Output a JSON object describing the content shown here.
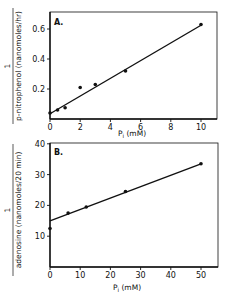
{
  "chart_data": [
    {
      "type": "scatter",
      "panel_label": "A.",
      "title": "",
      "xlabel": "Pi (mM)",
      "ylabel_numerator": "1",
      "ylabel_denominator": "p-nitrophenol (nanomoles/hr)",
      "xlim": [
        0,
        11
      ],
      "ylim": [
        0,
        0.7
      ],
      "x_ticks": [
        0,
        2,
        4,
        6,
        8,
        10
      ],
      "y_ticks": [
        0.2,
        0.4,
        0.6
      ],
      "x_tick_labels": [
        "0",
        "2",
        "4",
        "6",
        "8",
        "10"
      ],
      "y_tick_labels": [
        "0.2",
        "0.4",
        "0.6"
      ],
      "grid": false,
      "series": [
        {
          "name": "data",
          "x": [
            0,
            0.5,
            1,
            2,
            3,
            5,
            10
          ],
          "y": [
            0.04,
            0.06,
            0.075,
            0.21,
            0.23,
            0.32,
            0.63
          ]
        }
      ],
      "fit_line": {
        "x": [
          0,
          10
        ],
        "y": [
          0.035,
          0.625
        ]
      }
    },
    {
      "type": "scatter",
      "panel_label": "B.",
      "title": "",
      "xlabel": "Pi (mM)",
      "ylabel_numerator": "1",
      "ylabel_denominator": "adenosine (nanomoles/20 min)",
      "xlim": [
        0,
        55
      ],
      "ylim": [
        0,
        41
      ],
      "x_ticks": [
        0,
        10,
        20,
        30,
        40,
        50
      ],
      "y_ticks": [
        10,
        20,
        30,
        40
      ],
      "x_tick_labels": [
        "0",
        "10",
        "20",
        "30",
        "40",
        "50"
      ],
      "y_tick_labels": [
        "10",
        "20",
        "30",
        "40"
      ],
      "grid": false,
      "series": [
        {
          "name": "data",
          "x": [
            0,
            6,
            12,
            25,
            50
          ],
          "y": [
            12.5,
            17.5,
            19.5,
            24.5,
            33.5
          ]
        }
      ],
      "fit_line": {
        "x": [
          0,
          50
        ],
        "y": [
          15,
          33.5
        ]
      }
    }
  ],
  "labels": {
    "panelA": "A.",
    "panelB": "B.",
    "xlabel_main": "P",
    "xlabel_sub": "i",
    "xlabel_unit": " (mM)",
    "ylabelA_num": "1",
    "ylabelA_den": "p-nitrophenol (nanomoles/hr)",
    "ylabelB_num": "1",
    "ylabelB_den": "adenosine (nanomoles/20 min)"
  }
}
